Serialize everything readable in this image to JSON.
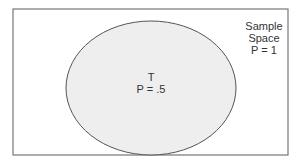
{
  "diagram": {
    "type": "venn",
    "sample_space": {
      "line1": "Sample",
      "line2": "Space",
      "line3": "P = 1"
    },
    "event": {
      "name": "T",
      "prob": "P = .5"
    },
    "colors": {
      "border": "#555555",
      "fill": "#eeeeee",
      "background": "#ffffff"
    }
  }
}
